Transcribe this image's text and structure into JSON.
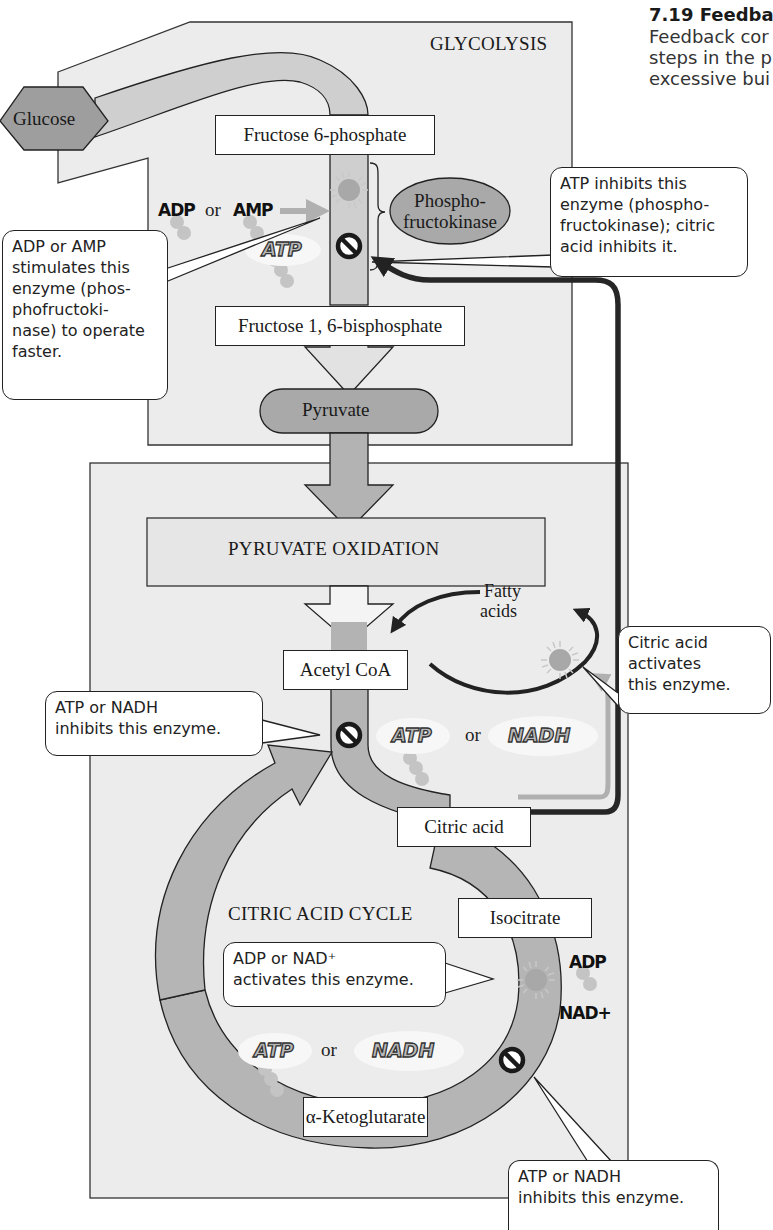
{
  "caption": {
    "title": "7.19 Feedba",
    "lines": [
      "Feedback cor",
      "steps in the p",
      "excessive bui"
    ]
  },
  "sections": {
    "glycolysis": "GLYCOLYSIS",
    "pyruvate_oxidation": "PYRUVATE OXIDATION",
    "citric_acid_cycle": "CITRIC ACID CYCLE"
  },
  "molecules": {
    "glucose": "Glucose",
    "fructose_6p": "Fructose 6-phosphate",
    "fructose_16bp": "Fructose 1, 6-bisphosphate",
    "pyruvate": "Pyruvate",
    "acetyl_coa": "Acetyl CoA",
    "fatty_acids_line1": "Fatty",
    "fatty_acids_line2": "acids",
    "citric_acid": "Citric acid",
    "isocitrate": "Isocitrate",
    "alpha_ketoglutarate": "α-Ketoglutarate"
  },
  "enzymes": {
    "pfk_line1": "Phospho-",
    "pfk_line2": "fructokinase"
  },
  "effectors": {
    "adp": "ADP",
    "amp": "AMP",
    "atp": "ATP",
    "nadh": "NADH",
    "nad_plus": "NAD+",
    "or": "or"
  },
  "callouts": {
    "adp_amp_stimulates": [
      "ADP or AMP",
      "stimulates this",
      "enzyme (phos-",
      "phofructoki-",
      "nase) to operate",
      "faster."
    ],
    "atp_inhibits_pfk": [
      "ATP inhibits this",
      "enzyme (phospho-",
      "fructokinase); citric",
      "acid inhibits it."
    ],
    "citric_activates": [
      "Citric acid",
      "activates",
      "this enzyme."
    ],
    "atp_nadh_inhibits_pdh": [
      "ATP or NADH",
      "inhibits this enzyme."
    ],
    "adp_nad_activates": [
      "ADP or NAD⁺",
      "activates this enzyme."
    ],
    "atp_nadh_inhibits_akg": [
      "ATP or NADH",
      "inhibits this enzyme."
    ]
  },
  "colors": {
    "panel_fill": "#ececec",
    "pathway_fill": "#bdbdbd",
    "node_fill": "#9a9a9a",
    "feedback_arrow": "#2a2a2a",
    "activation_arrow": "#b0b0b0",
    "enzyme_sun": "#a8a8a8"
  }
}
